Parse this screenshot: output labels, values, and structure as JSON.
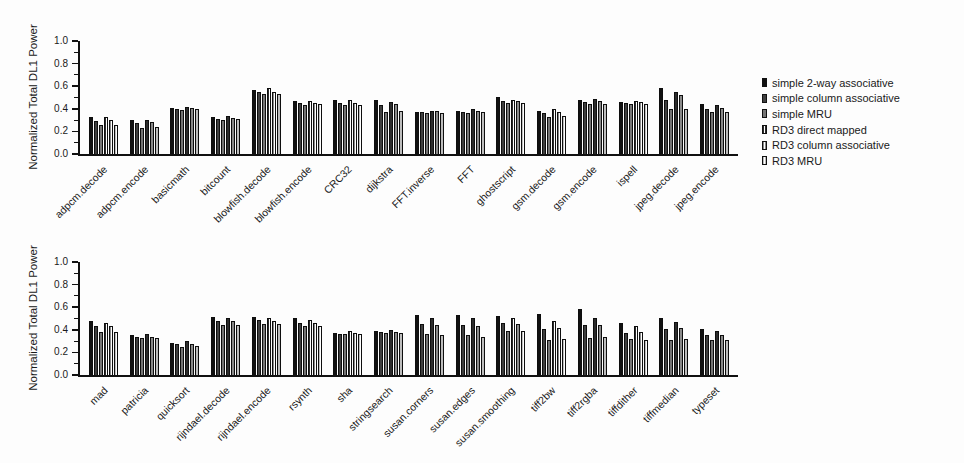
{
  "figure": {
    "background": "#fdfdfd",
    "text_color": "#1a1a1a",
    "axis_color": "#111111"
  },
  "legend": {
    "position": "right-of-top-panel",
    "items": [
      {
        "label": "simple 2-way associative",
        "color": "#111111",
        "pattern": "solid"
      },
      {
        "label": "simple column associative",
        "color": "#3f3f3f",
        "pattern": "solid"
      },
      {
        "label": "simple MRU",
        "color": "#757575",
        "pattern": "solid"
      },
      {
        "label": "RD3 direct mapped",
        "color": "#2c2c2c",
        "pattern": "striped"
      },
      {
        "label": "RD3 column associative",
        "color": "#8a8a8a",
        "pattern": "striped"
      },
      {
        "label": "RD3 MRU",
        "color": "#bdbdbd",
        "pattern": "striped"
      }
    ]
  },
  "chart_data": [
    {
      "type": "bar",
      "title": "",
      "xlabel": "",
      "ylabel": "Normalized Total DL1 Power",
      "ylim": [
        0.0,
        1.0
      ],
      "yticks": [
        0.0,
        0.2,
        0.4,
        0.6,
        0.8,
        1.0
      ],
      "yticklabels": [
        "0.0",
        "0.2",
        "0.4",
        "0.6",
        "0.8",
        "1.0"
      ],
      "minor_tick_step": 0.1,
      "grid": false,
      "legend_position": "right",
      "categories": [
        "adpcm.decode",
        "adpcm.encode",
        "basicmath",
        "bitcount",
        "blowfish.decode",
        "blowfish.encode",
        "CRC32",
        "dijkstra",
        "FFT.inverse",
        "FFT",
        "ghostscript",
        "gsm.decode",
        "gsm.encode",
        "ispell",
        "jpeg.decode",
        "jpeg.encode"
      ],
      "series": [
        {
          "name": "simple 2-way associative",
          "values": [
            0.33,
            0.3,
            0.41,
            0.33,
            0.57,
            0.47,
            0.48,
            0.48,
            0.37,
            0.38,
            0.5,
            0.38,
            0.48,
            0.46,
            0.58,
            0.44
          ]
        },
        {
          "name": "simple column associative",
          "values": [
            0.29,
            0.27,
            0.4,
            0.31,
            0.55,
            0.45,
            0.45,
            0.43,
            0.37,
            0.37,
            0.47,
            0.36,
            0.46,
            0.45,
            0.48,
            0.4
          ]
        },
        {
          "name": "simple MRU",
          "values": [
            0.26,
            0.23,
            0.39,
            0.3,
            0.53,
            0.43,
            0.43,
            0.37,
            0.36,
            0.36,
            0.45,
            0.33,
            0.44,
            0.44,
            0.4,
            0.37
          ]
        },
        {
          "name": "RD3 direct mapped",
          "values": [
            0.33,
            0.3,
            0.42,
            0.34,
            0.58,
            0.47,
            0.48,
            0.46,
            0.38,
            0.4,
            0.48,
            0.4,
            0.49,
            0.47,
            0.55,
            0.43
          ]
        },
        {
          "name": "RD3 column associative",
          "values": [
            0.3,
            0.28,
            0.41,
            0.32,
            0.55,
            0.45,
            0.45,
            0.44,
            0.38,
            0.38,
            0.47,
            0.37,
            0.47,
            0.46,
            0.52,
            0.41
          ]
        },
        {
          "name": "RD3 MRU",
          "values": [
            0.26,
            0.24,
            0.4,
            0.31,
            0.53,
            0.44,
            0.43,
            0.38,
            0.36,
            0.37,
            0.45,
            0.34,
            0.44,
            0.44,
            0.4,
            0.37
          ]
        }
      ]
    },
    {
      "type": "bar",
      "title": "",
      "xlabel": "",
      "ylabel": "Normalized Total DL1 Power",
      "ylim": [
        0.0,
        1.0
      ],
      "yticks": [
        0.0,
        0.2,
        0.4,
        0.6,
        0.8,
        1.0
      ],
      "yticklabels": [
        "0.0",
        "0.2",
        "0.4",
        "0.6",
        "0.8",
        "1.0"
      ],
      "minor_tick_step": 0.1,
      "grid": false,
      "legend_position": "none",
      "categories": [
        "mad",
        "patricia",
        "quicksort",
        "rijndael.decode",
        "rijndael.encode",
        "rsynth",
        "sha",
        "stringsearch",
        "susan.corners",
        "susan.edges",
        "susan.smoothing",
        "tiff2bw",
        "tiff2rgba",
        "tiffdither",
        "tiffmedian",
        "typeset"
      ],
      "series": [
        {
          "name": "simple 2-way associative",
          "values": [
            0.48,
            0.35,
            0.28,
            0.51,
            0.51,
            0.5,
            0.37,
            0.39,
            0.53,
            0.53,
            0.52,
            0.54,
            0.58,
            0.46,
            0.5,
            0.41
          ]
        },
        {
          "name": "simple column associative",
          "values": [
            0.43,
            0.34,
            0.27,
            0.48,
            0.49,
            0.46,
            0.36,
            0.38,
            0.45,
            0.44,
            0.46,
            0.41,
            0.44,
            0.37,
            0.41,
            0.35
          ]
        },
        {
          "name": "simple MRU",
          "values": [
            0.38,
            0.33,
            0.25,
            0.44,
            0.45,
            0.43,
            0.36,
            0.37,
            0.36,
            0.35,
            0.39,
            0.31,
            0.33,
            0.32,
            0.31,
            0.31
          ]
        },
        {
          "name": "RD3 direct mapped",
          "values": [
            0.46,
            0.36,
            0.3,
            0.5,
            0.5,
            0.49,
            0.39,
            0.4,
            0.5,
            0.5,
            0.5,
            0.48,
            0.5,
            0.43,
            0.47,
            0.39
          ]
        },
        {
          "name": "RD3 column associative",
          "values": [
            0.43,
            0.34,
            0.27,
            0.48,
            0.48,
            0.46,
            0.37,
            0.38,
            0.44,
            0.43,
            0.45,
            0.42,
            0.44,
            0.38,
            0.42,
            0.35
          ]
        },
        {
          "name": "RD3 MRU",
          "values": [
            0.38,
            0.33,
            0.26,
            0.44,
            0.45,
            0.43,
            0.36,
            0.37,
            0.35,
            0.34,
            0.39,
            0.32,
            0.34,
            0.31,
            0.32,
            0.31
          ]
        }
      ]
    }
  ]
}
